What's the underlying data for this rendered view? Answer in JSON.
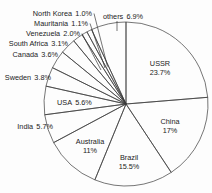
{
  "figure": {
    "background_color": "#fdfdfd",
    "line_color": "#3b3b3b",
    "text_color": "#1c1c1c"
  },
  "chart_data": {
    "type": "pie",
    "unit": "%",
    "total": 100,
    "start_angle_deg": 0,
    "direction": "clockwise",
    "legend": "none",
    "slices": [
      {
        "name": "USSR",
        "value": 23.7,
        "pct_label": "23.7%",
        "label_style": "inside-stacked"
      },
      {
        "name": "China",
        "value": 17,
        "pct_label": "17%",
        "label_style": "inside-stacked"
      },
      {
        "name": "Brazil",
        "value": 15.5,
        "pct_label": "15.5%",
        "label_style": "inside-stacked"
      },
      {
        "name": "Australia",
        "value": 11,
        "pct_label": "11%",
        "label_style": "inside-stacked"
      },
      {
        "name": "India",
        "value": 5.7,
        "pct_label": "5.7%",
        "label_style": "outside"
      },
      {
        "name": "USA",
        "value": 5.6,
        "pct_label": "5.6%",
        "label_style": "inside-single-line"
      },
      {
        "name": "Sweden",
        "value": 3.8,
        "pct_label": "3.8%",
        "label_style": "outside"
      },
      {
        "name": "Canada",
        "value": 3.6,
        "pct_label": "3.6%",
        "label_style": "outside"
      },
      {
        "name": "South Africa",
        "value": 3.1,
        "pct_label": "3.1%",
        "label_style": "outside"
      },
      {
        "name": "Venezuela",
        "value": 2.0,
        "pct_label": "2.0%",
        "label_style": "outside-leader-line"
      },
      {
        "name": "Mauritania",
        "value": 1.1,
        "pct_label": "1.1%",
        "label_style": "outside-leader-line"
      },
      {
        "name": "North Korea",
        "value": 1.0,
        "pct_label": "1.0%",
        "label_style": "outside-leader-line"
      },
      {
        "name": "others",
        "value": 6.9,
        "pct_label": "6.9%",
        "label_style": "outside-tick"
      }
    ]
  }
}
